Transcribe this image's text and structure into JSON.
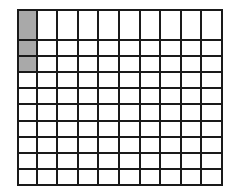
{
  "figure": {
    "name": "hundredths-grid",
    "rows": 10,
    "columns": 10,
    "total_cells": 100,
    "shaded_count": 3,
    "unshaded_count": 97,
    "shaded_cells": [
      {
        "row": 1,
        "column": 1
      },
      {
        "row": 2,
        "column": 1
      },
      {
        "row": 3,
        "column": 1
      }
    ]
  },
  "colors": {
    "shaded_fill": "#a9a9a9",
    "unshaded_fill": "#ffffff",
    "grid_line": "#1a1a1a",
    "background": "#ffffff"
  },
  "chart_data": {
    "type": "heatmap",
    "title": "",
    "xlabel": "",
    "ylabel": "",
    "categories": [
      "1",
      "2",
      "3",
      "4",
      "5",
      "6",
      "7",
      "8",
      "9",
      "10"
    ],
    "row_labels": [
      "1",
      "2",
      "3",
      "4",
      "5",
      "6",
      "7",
      "8",
      "9",
      "10"
    ],
    "grid": [
      [
        1,
        0,
        0,
        0,
        0,
        0,
        0,
        0,
        0,
        0
      ],
      [
        1,
        0,
        0,
        0,
        0,
        0,
        0,
        0,
        0,
        0
      ],
      [
        1,
        0,
        0,
        0,
        0,
        0,
        0,
        0,
        0,
        0
      ],
      [
        0,
        0,
        0,
        0,
        0,
        0,
        0,
        0,
        0,
        0
      ],
      [
        0,
        0,
        0,
        0,
        0,
        0,
        0,
        0,
        0,
        0
      ],
      [
        0,
        0,
        0,
        0,
        0,
        0,
        0,
        0,
        0,
        0
      ],
      [
        0,
        0,
        0,
        0,
        0,
        0,
        0,
        0,
        0,
        0
      ],
      [
        0,
        0,
        0,
        0,
        0,
        0,
        0,
        0,
        0,
        0
      ],
      [
        0,
        0,
        0,
        0,
        0,
        0,
        0,
        0,
        0,
        0
      ],
      [
        0,
        0,
        0,
        0,
        0,
        0,
        0,
        0,
        0,
        0
      ]
    ],
    "legend": [
      {
        "value": 1,
        "label": "shaded",
        "color": "#a9a9a9"
      },
      {
        "value": 0,
        "label": "unshaded",
        "color": "#ffffff"
      }
    ],
    "legend_position": "none",
    "grid_on": true
  }
}
